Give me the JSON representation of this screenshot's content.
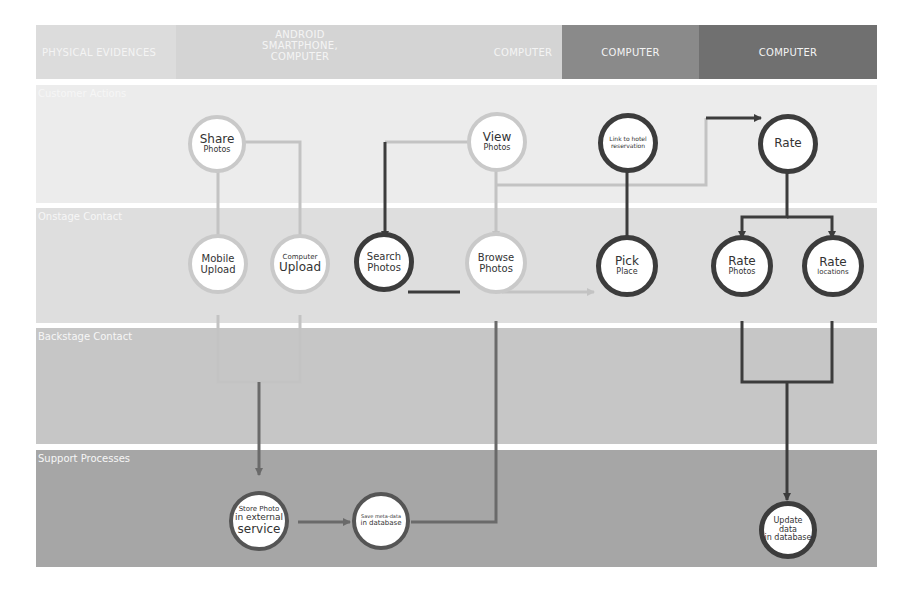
{
  "header": {
    "columns": [
      {
        "label": "PHYSICAL EVIDENCES",
        "color": "#dcdcdc"
      },
      {
        "label": "ANDROID SMARTPHONE, COMPUTER",
        "color": "#d4d4d4"
      },
      {
        "label": "COMPUTER",
        "color": "#d4d4d4"
      },
      {
        "label": "COMPUTER",
        "color": "#8a8a8a"
      },
      {
        "label": "COMPUTER",
        "color": "#707070"
      }
    ]
  },
  "lanes": [
    {
      "label": "Customer Actions",
      "color": "#ececec"
    },
    {
      "label": "Onstage Contact",
      "color": "#dedede"
    },
    {
      "label": "Backstage Contact",
      "color": "#c6c6c6"
    },
    {
      "label": "Support Processes",
      "color": "#a6a6a6"
    }
  ],
  "nodes": {
    "share_photos": {
      "line1": "Share",
      "line2": "Photos"
    },
    "view_photos": {
      "line1": "View",
      "line2": "Photos"
    },
    "link_hotel": {
      "line1": "Link to hotel",
      "line2": "reservation"
    },
    "rate": {
      "line1": "Rate"
    },
    "mobile_upload": {
      "line1": "Mobile",
      "line2": "Upload"
    },
    "computer_upload": {
      "line1": "Computer",
      "line2": "Upload"
    },
    "search_photos": {
      "line1": "Search",
      "line2": "Photos"
    },
    "browse_photos": {
      "line1": "Browse",
      "line2": "Photos"
    },
    "pick_place": {
      "line1": "Pick",
      "line2": "Place"
    },
    "rate_photos": {
      "line1": "Rate",
      "line2": "Photos"
    },
    "rate_locations": {
      "line1": "Rate",
      "line2": "locations"
    },
    "store_photo": {
      "line1": "Store Photo",
      "line2": "in external",
      "line3": "service"
    },
    "save_meta": {
      "line1": "Save meta-data",
      "line2": "in database"
    },
    "update_data": {
      "line1": "Update data",
      "line2": "in database"
    }
  },
  "colors": {
    "light_stroke": "#c9c9c9",
    "dark_stroke": "#3c3c3c",
    "mid_stroke": "#6a6a6a"
  }
}
